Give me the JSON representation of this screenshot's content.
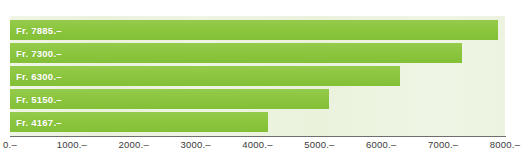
{
  "chart_data": {
    "type": "bar",
    "orientation": "horizontal",
    "title": "",
    "xlabel": "",
    "ylabel": "",
    "categories": [
      "",
      "",
      "",
      "",
      ""
    ],
    "values": [
      7885,
      7300,
      6300,
      5150,
      4167
    ],
    "data_labels": [
      "Fr. 7885.–",
      "Fr. 7300.–",
      "Fr. 6300.–",
      "Fr. 5150.–",
      "Fr. 4167.–"
    ],
    "xlim": [
      0,
      8000
    ],
    "xticks": [
      0,
      1000,
      2000,
      3000,
      4000,
      5000,
      6000,
      7000,
      8000
    ],
    "xtick_labels": [
      "0.–",
      "1000.–",
      "2000.–",
      "3000.–",
      "4000.–",
      "5000.–",
      "6000.–",
      "7000.–",
      "8000.–"
    ],
    "grid": false,
    "legend": null,
    "currency": "Fr.",
    "bar_color": "#8CC63F",
    "plot_background": "#EAF2DC",
    "label_color": "#FFFFFF",
    "axis_color": "#6F6F6F"
  },
  "bars": [
    {
      "label": "Fr. 7885.–",
      "value": 7885
    },
    {
      "label": "Fr. 7300.–",
      "value": 7300
    },
    {
      "label": "Fr. 6300.–",
      "value": 6300
    },
    {
      "label": "Fr. 5150.–",
      "value": 5150
    },
    {
      "label": "Fr. 4167.–",
      "value": 4167
    }
  ],
  "axis": {
    "ticks": [
      "0.–",
      "1000.–",
      "2000.–",
      "3000.–",
      "4000.–",
      "5000.–",
      "6000.–",
      "7000.–",
      "8000.–"
    ]
  },
  "title_crop": ""
}
